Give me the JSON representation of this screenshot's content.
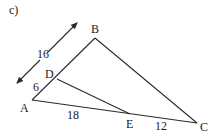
{
  "diagram": {
    "part_label": "c)",
    "colors": {
      "line": "#2a2a2a",
      "text": "#222222",
      "background": "#ffffff"
    },
    "points": {
      "A": {
        "label": "A",
        "x": 32,
        "y": 100
      },
      "B": {
        "label": "B",
        "x": 95,
        "y": 38
      },
      "C": {
        "label": "C",
        "x": 197,
        "y": 123
      },
      "D": {
        "label": "D",
        "x": 57,
        "y": 79
      },
      "E": {
        "label": "E",
        "x": 130,
        "y": 114
      }
    },
    "segments": [
      {
        "from": "A",
        "to": "B"
      },
      {
        "from": "B",
        "to": "C"
      },
      {
        "from": "A",
        "to": "C"
      },
      {
        "from": "D",
        "to": "E"
      }
    ],
    "measurements": {
      "AB": "16",
      "AD": "6",
      "AE": "18",
      "EC": "12"
    },
    "dimension_arrow": {
      "label": "16",
      "from": [
        16,
        84
      ],
      "to": [
        78,
        22
      ]
    }
  }
}
